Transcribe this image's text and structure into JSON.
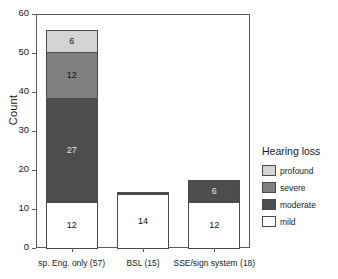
{
  "chart_data": {
    "type": "bar",
    "stacked": true,
    "title": "",
    "xlabel": "",
    "ylabel": "Count",
    "ylim": [
      0,
      60
    ],
    "yticks": [
      0,
      10,
      20,
      30,
      40,
      50,
      60
    ],
    "grid": false,
    "legend": {
      "title": "Hearing loss",
      "position": "right",
      "entries": [
        "profound",
        "severe",
        "moderate",
        "mild"
      ]
    },
    "categories": [
      "sp. Eng. only (57)",
      "BSL (15)",
      "SSE/sign system (18)"
    ],
    "series": [
      {
        "name": "mild",
        "color": "#ffffff",
        "values": [
          12,
          14,
          12
        ]
      },
      {
        "name": "moderate",
        "color": "#4d4d4d",
        "values": [
          27,
          1,
          6
        ]
      },
      {
        "name": "severe",
        "color": "#808080",
        "values": [
          12,
          0,
          0
        ]
      },
      {
        "name": "profound",
        "color": "#d4d4d4",
        "values": [
          6,
          0,
          0
        ]
      }
    ],
    "bar_labels": {
      "sp. Eng. only (57)": {
        "mild": "12",
        "moderate": "27",
        "severe": "12",
        "profound": "6"
      },
      "BSL (15)": {
        "mild": "14"
      },
      "SSE/sign system (18)": {
        "mild": "12",
        "moderate": "6"
      }
    },
    "totals": [
      57,
      15,
      18
    ]
  },
  "colors": {
    "profound": "#d4d4d4",
    "severe": "#808080",
    "moderate": "#4d4d4d",
    "mild": "#ffffff",
    "axis": "#5b5b5b",
    "outline": "#4a4a4a"
  }
}
